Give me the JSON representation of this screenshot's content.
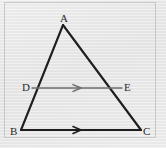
{
  "figure": {
    "kind": "geometry-diagram",
    "background_color": "#e9e9e9",
    "stroke_color": "#1e1e1e",
    "midsegment_color": "#6e6e6e",
    "frame_color": "#c7c7c7",
    "vertices": [
      {
        "id": "A",
        "label": "A",
        "x": 63,
        "y": 25
      },
      {
        "id": "B",
        "label": "B",
        "x": 21,
        "y": 130
      },
      {
        "id": "C",
        "label": "C",
        "x": 141,
        "y": 130
      },
      {
        "id": "D",
        "label": "D",
        "x": 32,
        "y": 88
      },
      {
        "id": "E",
        "label": "E",
        "x": 122,
        "y": 88
      }
    ],
    "segments": [
      {
        "id": "AB",
        "from": "A",
        "to": "B",
        "style": "solid",
        "weight": "heavy",
        "marker": "none"
      },
      {
        "id": "AC",
        "from": "A",
        "to": "C",
        "style": "solid",
        "weight": "heavy",
        "marker": "none"
      },
      {
        "id": "BC",
        "from": "B",
        "to": "C",
        "style": "solid",
        "weight": "heavy",
        "marker": "single-chevron"
      },
      {
        "id": "DE",
        "from": "D",
        "to": "E",
        "style": "solid",
        "weight": "light",
        "marker": "single-chevron"
      }
    ],
    "parallel_marks": [
      {
        "id": "mark-de",
        "on": "DE",
        "count": 1,
        "x": 77,
        "y": 88
      },
      {
        "id": "mark-bc",
        "on": "BC",
        "count": 1,
        "x": 77,
        "y": 130
      }
    ],
    "bleed_through_text": {
      "line_1": "",
      "line_2": "",
      "line_3": "",
      "line_4": ""
    }
  }
}
